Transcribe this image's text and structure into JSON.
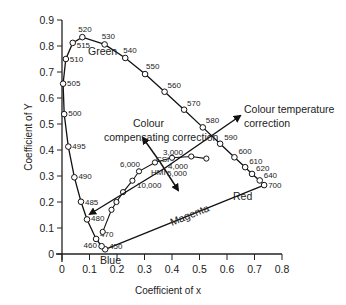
{
  "chart_data": {
    "type": "line",
    "title": "",
    "xlabel": "Coefficient of x",
    "ylabel": "Coefficient of Y",
    "xlim": [
      0,
      0.8
    ],
    "ylim": [
      0,
      0.9
    ],
    "x_ticks": [
      "0",
      "0.1",
      "0.2",
      "0.3",
      "0.4",
      "0.5",
      "0.6",
      "0.7",
      "0.8"
    ],
    "y_ticks": [
      "0",
      "0.1",
      "0.2",
      "0.3",
      "0.4",
      "0.5",
      "0.6",
      "0.7",
      "0.8",
      "0.9"
    ],
    "grid": false,
    "series": [
      {
        "name": "Spectral locus (nm)",
        "points": [
          {
            "label": "450",
            "x": 0.157,
            "y": 0.018
          },
          {
            "label": "460",
            "x": 0.144,
            "y": 0.03
          },
          {
            "label": "470",
            "x": 0.124,
            "y": 0.058
          },
          {
            "label": "480",
            "x": 0.091,
            "y": 0.133
          },
          {
            "label": "485",
            "x": 0.069,
            "y": 0.201
          },
          {
            "label": "490",
            "x": 0.045,
            "y": 0.295
          },
          {
            "label": "495",
            "x": 0.023,
            "y": 0.413
          },
          {
            "label": "500",
            "x": 0.008,
            "y": 0.538
          },
          {
            "label": "505",
            "x": 0.004,
            "y": 0.655
          },
          {
            "label": "510",
            "x": 0.014,
            "y": 0.75
          },
          {
            "label": "515",
            "x": 0.039,
            "y": 0.812
          },
          {
            "label": "520",
            "x": 0.074,
            "y": 0.834
          },
          {
            "label": "530",
            "x": 0.155,
            "y": 0.806
          },
          {
            "label": "540",
            "x": 0.23,
            "y": 0.754
          },
          {
            "label": "550",
            "x": 0.302,
            "y": 0.692
          },
          {
            "label": "560",
            "x": 0.373,
            "y": 0.624
          },
          {
            "label": "570",
            "x": 0.444,
            "y": 0.555
          },
          {
            "label": "580",
            "x": 0.512,
            "y": 0.487
          },
          {
            "label": "590",
            "x": 0.575,
            "y": 0.424
          },
          {
            "label": "600",
            "x": 0.627,
            "y": 0.372
          },
          {
            "label": "610",
            "x": 0.666,
            "y": 0.334
          },
          {
            "label": "620",
            "x": 0.691,
            "y": 0.308
          },
          {
            "label": "640",
            "x": 0.719,
            "y": 0.283
          },
          {
            "label": "700",
            "x": 0.735,
            "y": 0.265
          }
        ]
      },
      {
        "name": "Blackbody locus (K)",
        "points": [
          {
            "label": "",
            "x": 0.148,
            "y": 0.085
          },
          {
            "label": "10,000",
            "x": 0.18,
            "y": 0.17
          },
          {
            "label": "",
            "x": 0.198,
            "y": 0.2
          },
          {
            "label": "6,000",
            "x": 0.222,
            "y": 0.238
          },
          {
            "label": "5,000",
            "x": 0.256,
            "y": 0.282
          },
          {
            "label": "4,000",
            "x": 0.28,
            "y": 0.318
          },
          {
            "label": "3,000",
            "x": 0.338,
            "y": 0.352
          },
          {
            "label": "",
            "x": 0.4,
            "y": 0.37
          },
          {
            "label": "",
            "x": 0.47,
            "y": 0.375
          },
          {
            "label": "",
            "x": 0.525,
            "y": 0.367
          }
        ]
      }
    ],
    "annotations": [
      {
        "text": "Green",
        "x": 0.1,
        "y": 0.76
      },
      {
        "text": "Blue",
        "x": 0.145,
        "y": -0.03
      },
      {
        "text": "Red",
        "x": 0.63,
        "y": 0.22
      },
      {
        "text": "Magenta",
        "x": 0.38,
        "y": 0.115
      },
      {
        "text": "Colour",
        "x": 0.25,
        "y": 0.54
      },
      {
        "text": "compensating correction",
        "x": 0.22,
        "y": 0.485
      },
      {
        "text": "Colour temperature",
        "x": 0.72,
        "y": 0.48
      },
      {
        "text": "correction",
        "x": 0.72,
        "y": 0.43
      },
      {
        "text": "CSI",
        "x": 0.27,
        "y": 0.333
      },
      {
        "text": "HMI",
        "x": 0.228,
        "y": 0.196
      }
    ]
  },
  "labels": {
    "xlabel": "Coefficient of x",
    "ylabel": "Coefficient of Y",
    "green": "Green",
    "blue": "Blue",
    "red": "Red",
    "magenta": "Magenta",
    "colour_comp_1": "Colour",
    "colour_comp_2": "compensating correction",
    "colour_temp_1": "Colour temperature",
    "colour_temp_2": "correction",
    "csi": "CSI",
    "hmi": "HMI",
    "k3000": "3,000",
    "k4000": "4,000",
    "k5000": "5,000",
    "k6000": "6,000",
    "k10000": "10,000"
  }
}
